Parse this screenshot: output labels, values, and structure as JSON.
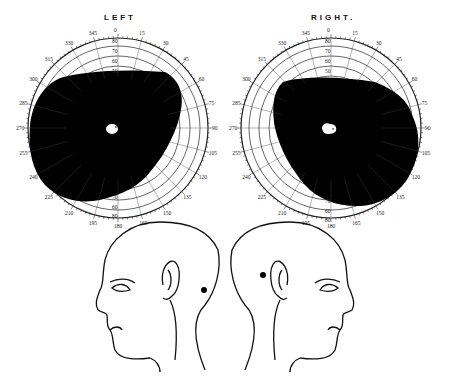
{
  "charts": {
    "left": {
      "title": "LEFT",
      "cx": 118,
      "cy": 128,
      "r": 90
    },
    "right": {
      "title": "RIGHT.",
      "cx": 331,
      "cy": 128,
      "r": 90
    }
  },
  "ring_labels": [
    "80",
    "70",
    "60",
    "50"
  ],
  "left_outer_labels": [
    "0",
    "15",
    "30",
    "45",
    "60",
    "75",
    "90",
    "105",
    "120",
    "135",
    "150",
    "165",
    "180",
    "195",
    "210",
    "225",
    "240",
    "255",
    "270",
    "285",
    "300",
    "315",
    "330",
    "345"
  ],
  "colors": {
    "scotoma": "#000000",
    "line": "#222222",
    "background": "#ffffff"
  },
  "chart_data": {
    "type": "polar-perimetry",
    "series": [
      {
        "name": "LEFT",
        "field_defect": "large dense scotoma covering nasal/central field with sparing at temporal-inferior crescent",
        "blind_spot": "small white spot near center"
      },
      {
        "name": "RIGHT.",
        "field_defect": "large dense scotoma covering temporal/central field with sparing at nasal-inferior crescent",
        "blind_spot": "small white spot near center"
      }
    ],
    "rings_deg": [
      80,
      70,
      60,
      50
    ],
    "heads": [
      {
        "side": "left-facing",
        "lesion": "dot behind ear (occipital)"
      },
      {
        "side": "right-facing",
        "lesion": "dot above and behind ear (parietal)"
      }
    ]
  }
}
